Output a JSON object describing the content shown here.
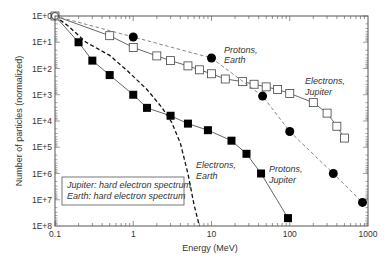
{
  "chart_data": {
    "type": "line",
    "title": "",
    "xlabel": "Energy (MeV)",
    "ylabel": "Number of particles (normalized)",
    "xscale": "log",
    "yscale": "log",
    "xlim": [
      0.1,
      1000
    ],
    "ylim_labels_top_to_bottom": [
      "1E+0",
      "1E+1",
      "1E+2",
      "1E+3",
      "1E+4",
      "1E+5",
      "1E+6",
      "1E+7",
      "1E+8"
    ],
    "x_tick_labels": [
      "0.1",
      "1",
      "10",
      "100",
      "1000"
    ],
    "y_tick_labels": [
      "1E+0",
      "1E+1",
      "1E+2",
      "1E+3",
      "1E+4",
      "1E+5",
      "1E+6",
      "1E+7",
      "1E+8"
    ],
    "grid": false,
    "legend_box": {
      "lines": [
        "Jupiter: hard electron spectrum",
        "Earth: hard electron spectrum"
      ],
      "position": "lower-left"
    },
    "series": [
      {
        "name": "Protons, Jupiter",
        "marker": "filled-square",
        "line": "solid",
        "color": "#555555",
        "points": [
          [
            0.1,
            0
          ],
          [
            0.2,
            1
          ],
          [
            0.3,
            1.7
          ],
          [
            0.5,
            2.25
          ],
          [
            1,
            3
          ],
          [
            1.5,
            3.5
          ],
          [
            3,
            3.8
          ],
          [
            5,
            4.1
          ],
          [
            9,
            4.35
          ],
          [
            18,
            4.75
          ],
          [
            28,
            5.25
          ],
          [
            43,
            6
          ],
          [
            95,
            7.7
          ]
        ]
      },
      {
        "name": "Electrons, Jupiter",
        "marker": "open-square",
        "line": "solid",
        "color": "#555555",
        "points": [
          [
            0.1,
            0
          ],
          [
            0.5,
            0.75
          ],
          [
            1,
            1.2
          ],
          [
            2,
            1.52
          ],
          [
            3,
            1.7
          ],
          [
            5,
            1.9
          ],
          [
            7,
            2.05
          ],
          [
            10,
            2.2
          ],
          [
            15,
            2.4
          ],
          [
            25,
            2.5
          ],
          [
            35,
            2.6
          ],
          [
            50,
            2.7
          ],
          [
            70,
            2.8
          ],
          [
            100,
            2.95
          ],
          [
            200,
            3.3
          ],
          [
            300,
            3.7
          ],
          [
            400,
            4.2
          ],
          [
            500,
            4.65
          ]
        ]
      },
      {
        "name": "Protons, Earth",
        "marker": "filled-circle",
        "line": "dashed",
        "color": "#777777",
        "points": [
          [
            0.1,
            0
          ],
          [
            1,
            0.8
          ],
          [
            10,
            1.6
          ],
          [
            45,
            3.05
          ],
          [
            100,
            4.4
          ],
          [
            360,
            6
          ],
          [
            850,
            7.1
          ]
        ]
      },
      {
        "name": "Electrons, Earth",
        "marker": "none",
        "line": "dashed",
        "color": "#111111",
        "points": [
          [
            0.1,
            0
          ],
          [
            0.15,
            0.4
          ],
          [
            0.25,
            1
          ],
          [
            0.5,
            1.5
          ],
          [
            0.85,
            2.1
          ],
          [
            1.5,
            2.8
          ],
          [
            2.3,
            3.47
          ],
          [
            3.1,
            4.05
          ],
          [
            4,
            4.85
          ],
          [
            5,
            6
          ],
          [
            6,
            7.2
          ],
          [
            7,
            8
          ]
        ]
      }
    ],
    "annotations": [
      {
        "text_lines": [
          "Protons,",
          "Earth"
        ],
        "series": "Protons, Earth"
      },
      {
        "text_lines": [
          "Electrons,",
          "Jupiter"
        ],
        "series": "Electrons, Jupiter"
      },
      {
        "text_lines": [
          "Electrons,",
          "Earth"
        ],
        "series": "Electrons, Earth"
      },
      {
        "text_lines": [
          "Protons,",
          "Jupiter"
        ],
        "series": "Protons, Jupiter"
      }
    ]
  },
  "labels": {
    "xlabel": "Energy (MeV)",
    "ylabel": "Number of particles (normalized)",
    "legend_line1": "Jupiter: hard electron spectrum",
    "legend_line2": "Earth: hard electron spectrum",
    "annot_protons_earth_1": "Protons,",
    "annot_protons_earth_2": "Earth",
    "annot_electrons_jupiter_1": "Electrons,",
    "annot_electrons_jupiter_2": "Jupiter",
    "annot_electrons_earth_1": "Electrons,",
    "annot_electrons_earth_2": "Earth",
    "annot_protons_jupiter_1": "Protons,",
    "annot_protons_jupiter_2": "Jupiter"
  }
}
